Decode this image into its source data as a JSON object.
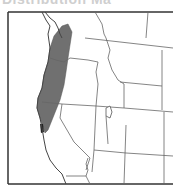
{
  "title": {
    "text": "Distribution Ma"
  },
  "map": {
    "region": "Western United States",
    "frame": {
      "x": 8,
      "y": 12,
      "right": 173,
      "bottom": 184
    },
    "colors": {
      "background": "#ffffff",
      "border": "#333333",
      "state_lines": "#666666",
      "range_fill": "#707070",
      "range_dark": "#222222"
    },
    "range": {
      "description": "Shaded distribution along the Pacific coast from western Washington through western Oregon into northwestern California"
    },
    "features": [
      "Puget Sound",
      "Great Salt Lake",
      "San Francisco Bay"
    ]
  }
}
